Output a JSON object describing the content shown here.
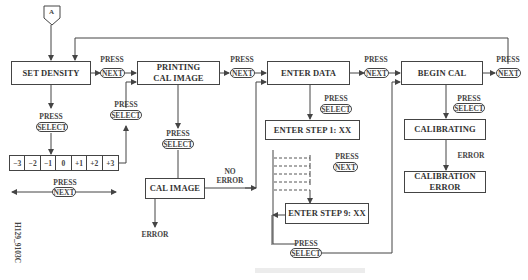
{
  "diagram": {
    "connector_start": "A",
    "boxes": {
      "set_density": "SET DENSITY",
      "printing_cal_image": "PRINTING\nCAL IMAGE",
      "enter_data": "ENTER DATA",
      "begin_cal": "BEGIN CAL",
      "cal_image": "CAL IMAGE",
      "enter_step_1": "ENTER STEP 1: XX",
      "enter_step_9": "ENTER STEP 9: XX",
      "calibrating": "CALIBRATING",
      "calibration_error": "CALIBRATION ERROR"
    },
    "press_label": "PRESS",
    "keys": {
      "next": "NEXT",
      "select": "SELECT"
    },
    "labels": {
      "no_error": "NO\nERROR",
      "error_cal_image": "ERROR",
      "error_calibrating": "ERROR"
    },
    "density_scale": [
      "−3",
      "−2",
      "−1",
      "0",
      "+1",
      "+2",
      "+3"
    ],
    "figure_id": "H129_9103C",
    "line_color": "#444444",
    "background_color": "#ffffff"
  }
}
